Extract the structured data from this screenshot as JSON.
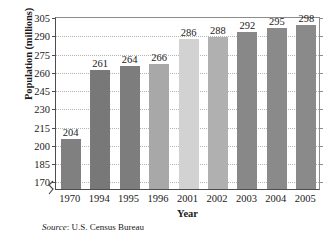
{
  "chart_data": {
    "type": "bar",
    "title": "",
    "xlabel": "Year",
    "ylabel": "Population (millions)",
    "categories": [
      "1970",
      "1994",
      "1995",
      "1996",
      "2001",
      "2002",
      "2003",
      "2004",
      "2005"
    ],
    "values": [
      204,
      261,
      264,
      266,
      286,
      288,
      292,
      295,
      298
    ],
    "bar_colors": [
      "#808080",
      "#787878",
      "#7d7d7d",
      "#a8a8a8",
      "#d2d2d2",
      "#b0b0b0",
      "#888888",
      "#8a8a8a",
      "#8a8a8a"
    ],
    "ylim": [
      163,
      305
    ],
    "yticks": [
      170,
      185,
      200,
      215,
      230,
      245,
      260,
      275,
      290,
      305
    ],
    "ytick_labels": [
      "170",
      "185",
      "200",
      "215",
      "230",
      "245",
      "260",
      "275",
      "290",
      "305"
    ],
    "grid": true,
    "grid_axis": "y",
    "legend": null,
    "axis_break": true,
    "data_labels": [
      "204",
      "261",
      "264",
      "266",
      "286",
      "288",
      "292",
      "295",
      "298"
    ]
  },
  "source_note": {
    "label": "Source",
    "text": ": U.S. Census Bureau"
  }
}
